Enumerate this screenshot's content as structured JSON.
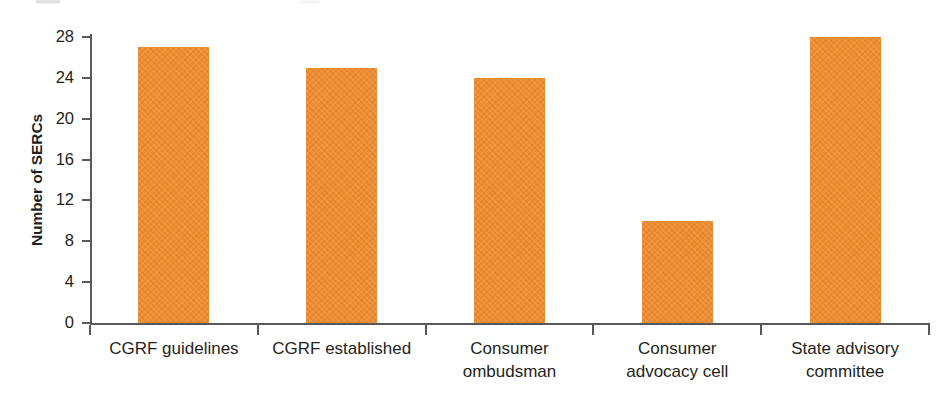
{
  "chart_data": {
    "type": "bar",
    "title": "",
    "xlabel": "",
    "ylabel": "Number of SERCs",
    "categories": [
      "CGRF guidelines",
      "CGRF established",
      "Consumer ombudsman",
      "Consumer advocacy cell",
      "State advisory committee"
    ],
    "category_lines": [
      [
        "CGRF guidelines"
      ],
      [
        "CGRF established"
      ],
      [
        "Consumer",
        "ombudsman"
      ],
      [
        "Consumer",
        "advocacy cell"
      ],
      [
        "State advisory",
        "committee"
      ]
    ],
    "values": [
      27,
      25,
      24,
      10,
      28
    ],
    "ylim": [
      0,
      28
    ],
    "yticks": [
      0,
      4,
      8,
      12,
      16,
      20,
      24,
      28
    ],
    "ytick_labels": [
      "0",
      "4",
      "8",
      "12",
      "16",
      "20",
      "24",
      "28"
    ],
    "grid": false,
    "legend": null,
    "legend_position": "none",
    "bar_color": "#ef8b2c",
    "axis_color": "#58595b",
    "text_color": "#231f20"
  }
}
